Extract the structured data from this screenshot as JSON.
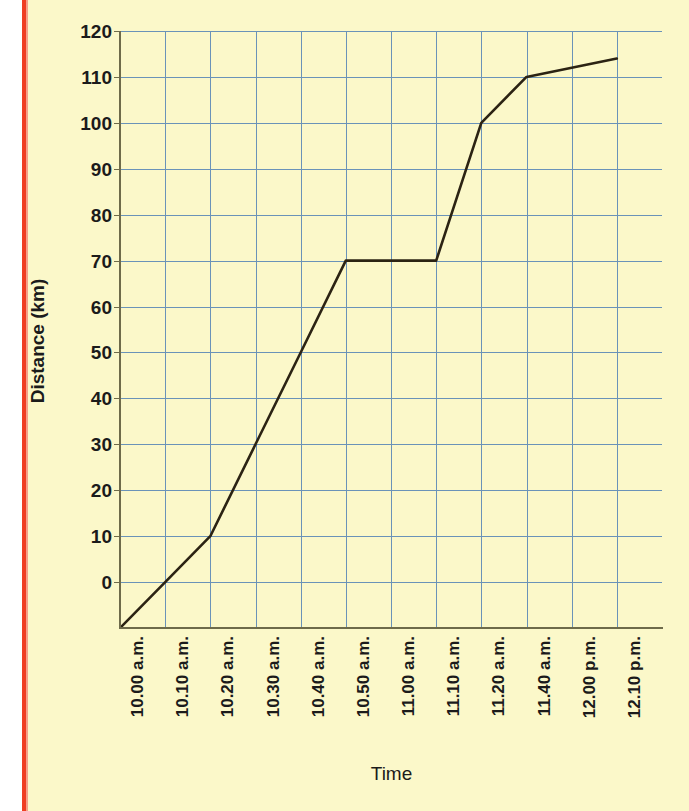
{
  "page": {
    "background_color": "#fbf8c9",
    "accent_rule_color": "#ef3e23"
  },
  "chart_data": {
    "type": "line",
    "title": "",
    "xlabel": "Time",
    "ylabel": "Distance (km)",
    "grid": true,
    "grid_color": "#6a93b8",
    "line_color": "#2b2313",
    "legend": "none",
    "categories": [
      "10.00 a.m.",
      "10.10 a.m.",
      "10.20 a.m.",
      "10.30 a.m.",
      "10.40 a.m.",
      "10.50 a.m.",
      "11.00 a.m.",
      "11.10 a.m.",
      "11.20 a.m.",
      "11.40 a.m.",
      "12.00 p.m.",
      "12.10 p.m."
    ],
    "values": [
      -10,
      0,
      10,
      30,
      50,
      70,
      70,
      70,
      100,
      110,
      112,
      114
    ],
    "ylim": [
      -10,
      120
    ],
    "yticks": [
      120,
      110,
      100,
      90,
      80,
      70,
      60,
      50,
      40,
      30,
      20,
      10,
      0
    ],
    "ytick_labels": [
      "120",
      "110",
      "100",
      "90",
      "80",
      "70",
      "60",
      "50",
      "40",
      "30",
      "20",
      "10",
      "0"
    ],
    "annotations": [
      "Line starts at bottom-left corner of plot below the 0 gridline",
      "Flat plateau at 70 km between 10.50 a.m. and 11.10 a.m.",
      "Steep climb from 70 km to 100 km between 11.10 a.m. and 11.20 a.m.",
      "Shallow final segment from 110 km at 11.40 a.m. to 114 km at 12.10 p.m."
    ]
  }
}
